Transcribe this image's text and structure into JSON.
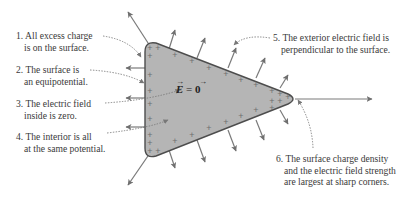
{
  "diagram": {
    "center_equation": "E = 0",
    "center_equation_display": {
      "lhs": "E",
      "eq": " = ",
      "rhs": "0"
    },
    "colors": {
      "conductor_fill": "#b5b5b5",
      "conductor_stroke": "#4d4d4d",
      "field_arrow": "#7a7a7a",
      "charge_sign": "#6e6e6e",
      "leader_line": "#777777",
      "text": "#3a3a3a"
    },
    "charge_symbol": "+",
    "annotations": [
      {
        "number": "1.",
        "line1": "All excess charge",
        "line2": "is on the surface."
      },
      {
        "number": "2.",
        "line1": "The surface is",
        "line2": "an equipotential."
      },
      {
        "number": "3.",
        "line1": "The electric field",
        "line2": "inside is zero."
      },
      {
        "number": "4.",
        "line1": "The interior is all",
        "line2": "at the same potential."
      },
      {
        "number": "5.",
        "line1": "The exterior electric field is",
        "line2": "perpendicular to the surface."
      },
      {
        "number": "6.",
        "line1": "The surface charge density",
        "line2": "and the electric field strength",
        "line3": "are largest at sharp corners."
      }
    ]
  }
}
